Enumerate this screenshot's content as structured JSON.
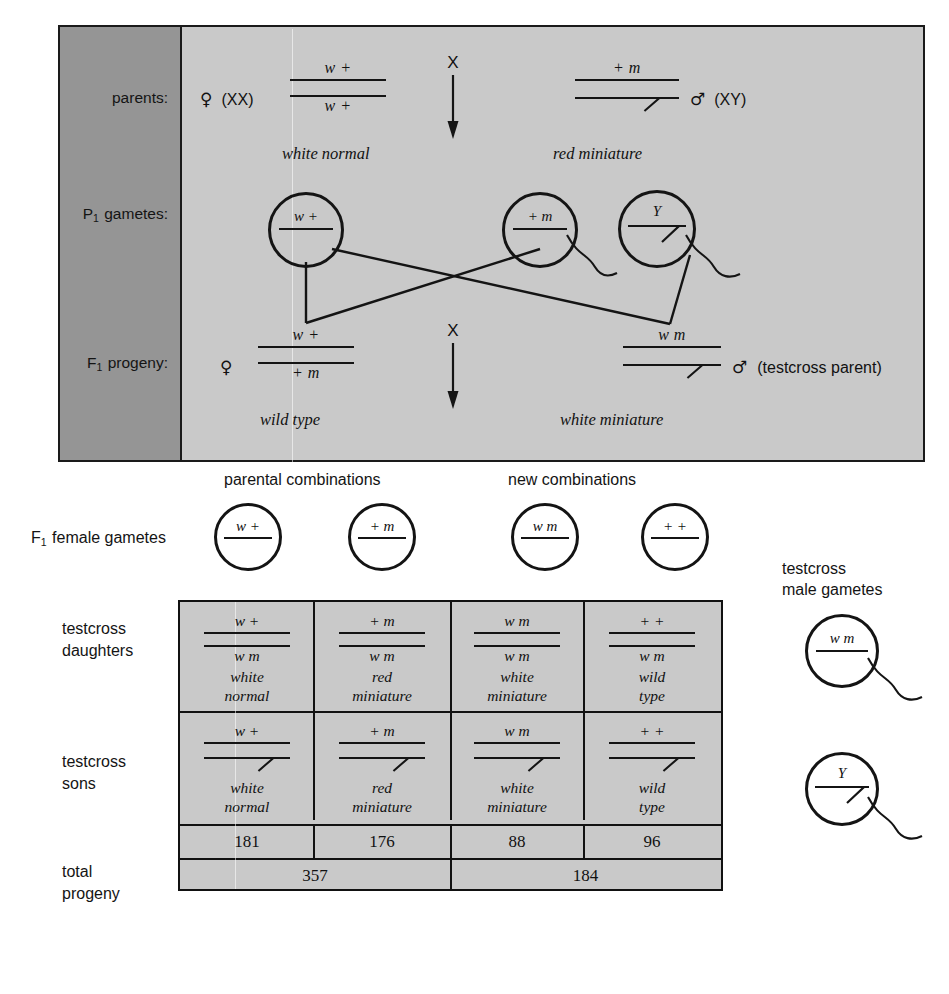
{
  "cross_panel": {
    "rows": [
      {
        "label": "parents:",
        "label_sub": ""
      },
      {
        "label": "P",
        "label_sub": "1",
        "label_tail": " gametes:"
      },
      {
        "label": "F",
        "label_sub": "1",
        "label_tail": " progeny:"
      }
    ],
    "row_labels": {
      "parents": "parents:",
      "p1_gametes_prefix": "P",
      "p1_gametes_sub": "1",
      "p1_gametes_tail": "gametes:",
      "f1_progeny_prefix": "F",
      "f1_progeny_sub": "1",
      "f1_progeny_tail": "progeny:"
    },
    "female_parent": {
      "sex_symbol": "♀",
      "karyotype": "(XX)",
      "allele_top": "w +",
      "allele_bottom": "w +",
      "phenotype": "white normal"
    },
    "male_parent": {
      "sex_symbol": "♂",
      "karyotype": "(XY)",
      "allele_top": "+ m",
      "allele_bottom_is_y": true,
      "phenotype": "red miniature"
    },
    "cross_symbol_top": "X",
    "cross_symbol_bottom": "X",
    "p1_gametes": [
      {
        "label": "w +",
        "type": "egg"
      },
      {
        "label": "+ m",
        "type": "sperm"
      },
      {
        "label": "Y",
        "type": "sperm-y"
      }
    ],
    "f1_female": {
      "sex_symbol": "♀",
      "allele_top": "w +",
      "allele_bottom": "+ m",
      "phenotype": "wild type"
    },
    "f1_male": {
      "sex_symbol": "♂",
      "note": "(testcross parent)",
      "allele_top": "w m",
      "allele_bottom_is_y": true,
      "phenotype": "white miniature"
    }
  },
  "middle": {
    "f1_female_gametes_prefix": "F",
    "f1_female_gametes_sub": "1",
    "f1_female_gametes_tail": "female gametes",
    "group_parental": "parental combinations",
    "group_new": "new combinations",
    "gametes": [
      "w +",
      "+ m",
      "w m",
      "+ +"
    ]
  },
  "right": {
    "title_line1": "testcross",
    "title_line2": "male gametes",
    "gametes": [
      {
        "label": "w m",
        "type": "sperm"
      },
      {
        "label": "Y",
        "type": "sperm-y"
      }
    ]
  },
  "table": {
    "row_labels": {
      "daughters_line1": "testcross",
      "daughters_line2": "daughters",
      "sons_line1": "testcross",
      "sons_line2": "sons",
      "total_line1": "total",
      "total_line2": "progeny"
    },
    "daughters": [
      {
        "top": "w +",
        "bottom": "w m",
        "phen1": "white",
        "phen2": "normal"
      },
      {
        "top": "+ m",
        "bottom": "w m",
        "phen1": "red",
        "phen2": "miniature"
      },
      {
        "top": "w m",
        "bottom": "w m",
        "phen1": "white",
        "phen2": "miniature"
      },
      {
        "top": "+ +",
        "bottom": "w m",
        "phen1": "wild",
        "phen2": "type"
      }
    ],
    "sons": [
      {
        "top": "w +",
        "bottom_is_y": true,
        "phen1": "white",
        "phen2": "normal"
      },
      {
        "top": "+ m",
        "bottom_is_y": true,
        "phen1": "red",
        "phen2": "miniature"
      },
      {
        "top": "w m",
        "bottom_is_y": true,
        "phen1": "white",
        "phen2": "miniature"
      },
      {
        "top": "+ +",
        "bottom_is_y": true,
        "phen1": "wild",
        "phen2": "type"
      }
    ],
    "totals": [
      "181",
      "176",
      "88",
      "96"
    ],
    "subtotals": [
      "357",
      "184"
    ]
  },
  "colors": {
    "panel_bg": "#c9c9c9",
    "sidebar_bg": "#959595",
    "ink": "#141414",
    "page_bg": "#ffffff"
  }
}
